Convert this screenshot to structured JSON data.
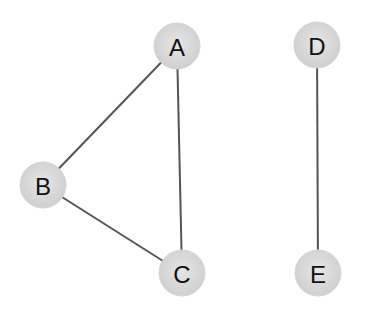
{
  "diagram": {
    "type": "undirected-graph",
    "node_radius": 23,
    "colors": {
      "background": "#ffffff",
      "node_fill": "#d6d6d6",
      "node_fill_center": "#e4e4e4",
      "edge": "#555555",
      "label": "#111111"
    },
    "nodes": [
      {
        "id": "A",
        "label": "A",
        "x": 177,
        "y": 46
      },
      {
        "id": "B",
        "label": "B",
        "x": 43,
        "y": 185
      },
      {
        "id": "C",
        "label": "C",
        "x": 182,
        "y": 273
      },
      {
        "id": "D",
        "label": "D",
        "x": 317,
        "y": 45
      },
      {
        "id": "E",
        "label": "E",
        "x": 318,
        "y": 273
      }
    ],
    "edges": [
      {
        "from": "A",
        "to": "B"
      },
      {
        "from": "A",
        "to": "C"
      },
      {
        "from": "B",
        "to": "C"
      },
      {
        "from": "D",
        "to": "E"
      }
    ]
  }
}
